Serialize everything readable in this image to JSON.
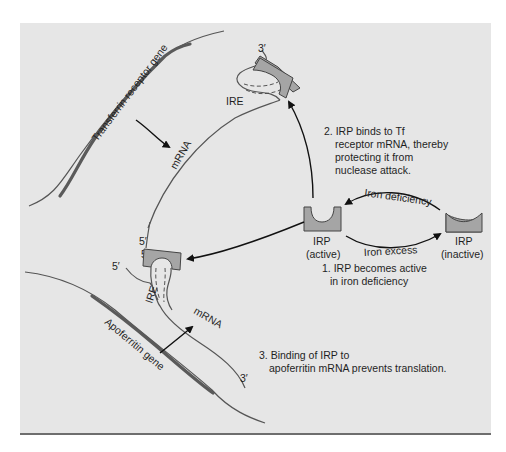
{
  "diagram": {
    "genes": {
      "transferrin": {
        "label": "Transferrin receptor gene"
      },
      "apoferritin": {
        "label": "Apoferritin gene"
      }
    },
    "mrna": {
      "tf_label": "mRNA",
      "apo_label": "mRNA",
      "tf_ire": "IRE",
      "apo_ire": "IRE",
      "tf_three_prime": "3′",
      "tf_five_prime": "5′",
      "apo_five_prime_top": "5′",
      "apo_five_prime": "5′",
      "apo_three_prime": "3′"
    },
    "irp_states": {
      "active": {
        "name": "IRP",
        "state": "(active)"
      },
      "inactive": {
        "name": "IRP",
        "state": "(inactive)"
      }
    },
    "transitions": {
      "to_active": "Iron deficiency",
      "to_inactive": "Iron excess"
    },
    "steps": {
      "step1": {
        "line1": "1. IRP becomes active",
        "line2": "in iron deficiency"
      },
      "step2": {
        "line1": "2. IRP binds to Tf",
        "line2": "receptor mRNA, thereby",
        "line3": "protecting it from",
        "line4": "nuclease attack."
      },
      "step3": {
        "line1": "3. Binding of IRP to",
        "line2": "apoferritin mRNA prevents translation."
      }
    },
    "colors": {
      "panel_bg": "#e6e6e6",
      "irp_fill": "#a5a5a5",
      "line": "#555555",
      "text": "#1f1f1f"
    }
  }
}
